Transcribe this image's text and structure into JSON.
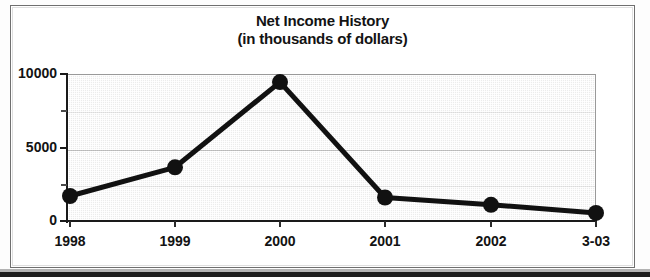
{
  "chart_data": {
    "type": "line",
    "title": "Net Income History",
    "subtitle": "(in thousands of dollars)",
    "title_lines": [
      "Net Income History",
      "(in thousands of dollars)"
    ],
    "xlabel": "",
    "ylabel": "",
    "categories": [
      "1998",
      "1999",
      "2000",
      "2001",
      "2002",
      "3-03"
    ],
    "values": [
      1700,
      3650,
      9450,
      1600,
      1100,
      550
    ],
    "series": [
      {
        "name": "Net Income",
        "values": [
          1700,
          3650,
          9450,
          1600,
          1100,
          550
        ]
      }
    ],
    "ylim": [
      0,
      10000
    ],
    "ytick_labels": [
      "0",
      "5000",
      "10000"
    ],
    "ytick_values": [
      0,
      5000,
      10000
    ],
    "yminor_tick_values": [
      2500,
      7500
    ],
    "grid": true,
    "legend": "none",
    "marker": "filled-circle",
    "line_color": "#111111",
    "marker_color": "#111111",
    "plot_background": "#ececec",
    "grid_color": "#787878",
    "axis_color": "#1a1a1a",
    "text_color": "#131313"
  }
}
